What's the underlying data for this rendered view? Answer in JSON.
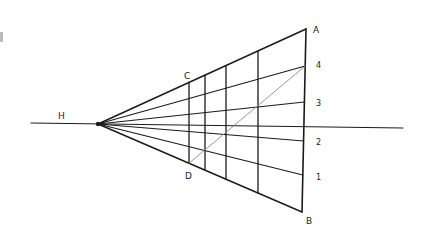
{
  "diagram": {
    "labels": {
      "horizon": "H",
      "corner_top_right": "A",
      "corner_bottom_right": "B",
      "corner_top_left": "C",
      "corner_bottom_left": "D",
      "division_4": "4",
      "division_3": "3",
      "division_2": "2",
      "division_1": "1"
    },
    "colors": {
      "ink": "#1a1a1a",
      "diagonal": "#8a8a8a",
      "background": "#ffffff"
    },
    "vanishing_point": {
      "x": 98,
      "y": 124
    },
    "horizon_line": {
      "x1": 31,
      "y1": 123,
      "x2": 403,
      "y2": 128
    },
    "right_edge": {
      "top": {
        "x": 306,
        "y": 29
      },
      "bottom": {
        "x": 302,
        "y": 212
      }
    },
    "verticals_x": [
      189,
      205,
      226,
      258
    ],
    "right_divisions_y": [
      29,
      66,
      102,
      141,
      175,
      212
    ],
    "diagonal": {
      "from": "4",
      "to": "D"
    }
  }
}
